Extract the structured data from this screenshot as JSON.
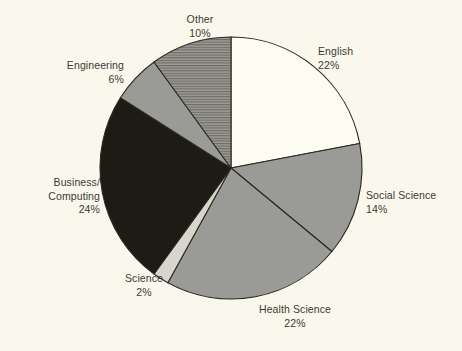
{
  "chart_data": {
    "type": "pie",
    "title": "",
    "subtitle": "",
    "xlabel": "",
    "ylabel": "",
    "legend_position": "none",
    "grid": false,
    "start_angle_deg": 0,
    "direction": "clockwise",
    "total_percent": 100,
    "categories": [
      "English",
      "Social Science",
      "Health Science",
      "Science",
      "Business/Computing",
      "Engineering",
      "Other"
    ],
    "values": [
      22,
      14,
      22,
      2,
      24,
      6,
      10
    ],
    "value_unit": "%",
    "slices": [
      {
        "name": "English",
        "label_lines": [
          "English",
          "22%"
        ],
        "value": 22,
        "value_text": "22%",
        "fill": "#fdfcf2",
        "pattern": "solid",
        "label_align": "left"
      },
      {
        "name": "Social Science",
        "label_lines": [
          "Social Science",
          "14%"
        ],
        "value": 14,
        "value_text": "14%",
        "fill": "#9a9a96",
        "pattern": "solid",
        "label_align": "left"
      },
      {
        "name": "Health Science",
        "label_lines": [
          "Health Science",
          "22%"
        ],
        "value": 22,
        "value_text": "22%",
        "fill": "#9a9a96",
        "pattern": "solid",
        "label_align": "center"
      },
      {
        "name": "Science",
        "label_lines": [
          "Science",
          "2%"
        ],
        "value": 2,
        "value_text": "2%",
        "fill": "#d8d6cc",
        "pattern": "solid",
        "label_align": "center"
      },
      {
        "name": "Business/Computing",
        "label_lines": [
          "Business/",
          "Computing",
          "24%"
        ],
        "value": 24,
        "value_text": "24%",
        "fill": "#1e1b14",
        "pattern": "solid",
        "label_align": "right"
      },
      {
        "name": "Engineering",
        "label_lines": [
          "Engineering",
          "6%"
        ],
        "value": 6,
        "value_text": "6%",
        "fill": "#9a9a96",
        "pattern": "solid",
        "label_align": "right"
      },
      {
        "name": "Other",
        "label_lines": [
          "Other",
          "10%"
        ],
        "value": 10,
        "value_text": "10%",
        "fill": "#97968f",
        "pattern": "horizontal-hatch",
        "label_align": "center"
      }
    ],
    "colors": {
      "background": "#faf8ec",
      "outline": "#2a2820",
      "text": "#3b3a33",
      "light": "#fdfcf2",
      "gray": "#9a9a96",
      "pale_gray": "#d8d6cc",
      "dark": "#1e1b14"
    },
    "geometry": {
      "center_x": 231,
      "center_y": 168,
      "radius": 131
    },
    "label_positions": [
      {
        "x": 318,
        "y": 45,
        "align": "left"
      },
      {
        "x": 366,
        "y": 189,
        "align": "left"
      },
      {
        "x": 295,
        "y": 303,
        "align": "center"
      },
      {
        "x": 144,
        "y": 272,
        "align": "center"
      },
      {
        "x": 100,
        "y": 176,
        "align": "right"
      },
      {
        "x": 124,
        "y": 59,
        "align": "right"
      },
      {
        "x": 200,
        "y": 13,
        "align": "center"
      }
    ]
  }
}
